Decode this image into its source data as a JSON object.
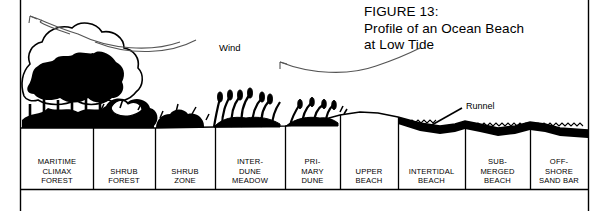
{
  "figure": {
    "title_lines": "FIGURE 13:\nProfile of an Ocean Beach\nat Low Tide",
    "wind_label": "Wind",
    "runnel_label": "Runnel",
    "ink_color": "#000000",
    "background_color": "#ffffff"
  },
  "zones": [
    {
      "label": "MARITIME\nCLIMAX\nFOREST",
      "name": "maritime-climax-forest",
      "x": 21,
      "w": 72,
      "top": 131
    },
    {
      "label": "SHRUB\nFOREST",
      "name": "shrub-forest",
      "x": 93,
      "w": 62,
      "top": 131
    },
    {
      "label": "SHRUB\nZONE",
      "name": "shrub-zone",
      "x": 155,
      "w": 60,
      "top": 131
    },
    {
      "label": "INTER-\nDUNE\nMEADOW",
      "name": "interdune-meadow",
      "x": 215,
      "w": 70,
      "top": 131
    },
    {
      "label": "PRI-\nMARY\nDUNE",
      "name": "primary-dune",
      "x": 285,
      "w": 55,
      "top": 131
    },
    {
      "label": "UPPER\nBEACH",
      "name": "upper-beach",
      "x": 340,
      "w": 58,
      "top": 127
    },
    {
      "label": "INTERTIDAL\nBEACH",
      "name": "intertidal-beach",
      "x": 398,
      "w": 67,
      "top": 131
    },
    {
      "label": "SUB-\nMERGED\nBEACH",
      "name": "submerged-beach",
      "x": 465,
      "w": 65,
      "top": 129
    },
    {
      "label": "OFF-\nSHORE\nSAND BAR",
      "name": "offshore-sand-bar",
      "x": 530,
      "w": 58,
      "top": 129
    }
  ]
}
